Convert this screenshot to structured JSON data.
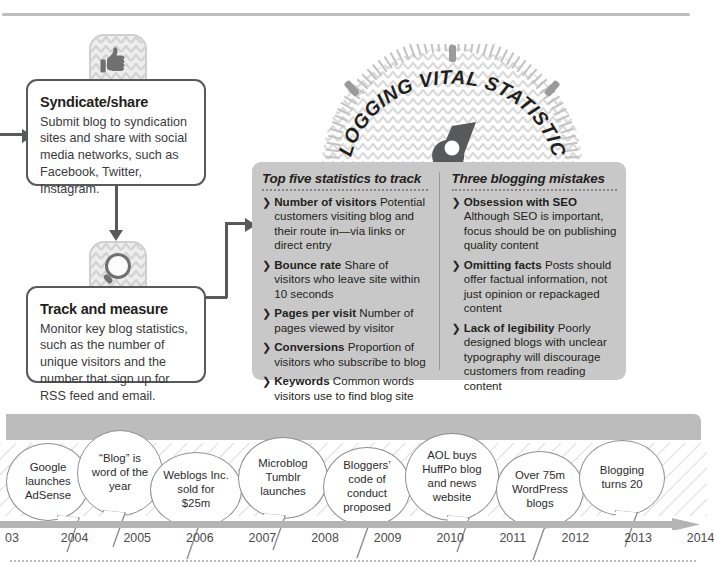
{
  "page": {
    "background": "#ffffff",
    "accent_gray": "#c8c8c8",
    "line_color": "#58595b"
  },
  "gauge": {
    "title": "BLOGGING VITAL STATISTICS",
    "needle": "gauge-needle"
  },
  "flow": {
    "steps": [
      {
        "icon": "thumbs-up-icon",
        "title": "Syndicate/share",
        "body": "Submit blog to syndication sites and share with social media networks, such as Facebook, Twitter, Instagram."
      },
      {
        "icon": "magnifier-icon",
        "title": "Track and measure",
        "body": "Monitor key blog statistics, such as the number of unique visitors and the number that sign up for RSS feed and email."
      }
    ]
  },
  "panel": {
    "left": {
      "heading": "Top five statistics to track",
      "items": [
        {
          "term": "Number of visitors",
          "desc": "Potential customers visiting blog and their route in—via links or direct entry"
        },
        {
          "term": "Bounce rate",
          "desc": "Share of visitors who leave site within 10 seconds"
        },
        {
          "term": "Pages per visit",
          "desc": "Number of pages viewed by visitor"
        },
        {
          "term": "Conversions",
          "desc": "Proportion of visitors who subscribe to blog"
        },
        {
          "term": "Keywords",
          "desc": "Common words visitors use to find blog site"
        }
      ]
    },
    "right": {
      "heading": "Three blogging mistakes",
      "items": [
        {
          "term": "Obsession with SEO",
          "desc": "Although SEO is important, focus should be on publishing quality content"
        },
        {
          "term": "Omitting facts",
          "desc": "Posts should offer factual information, not just opinion or repackaged content"
        },
        {
          "term": "Lack of legibility",
          "desc": "Poorly designed blogs with unclear typography will discourage customers from reading content"
        }
      ]
    },
    "bullet_glyph": "❯"
  },
  "timeline": {
    "years": [
      "03",
      "2004",
      "2005",
      "2006",
      "2007",
      "2008",
      "2009",
      "2010",
      "2011",
      "2012",
      "2013",
      "2014"
    ],
    "events": [
      {
        "year": "2003",
        "text": "Google launches AdSense"
      },
      {
        "year": "2004",
        "text": "“Blog” is word of the year"
      },
      {
        "year": "2005",
        "text": "Weblogs Inc. sold for $25m"
      },
      {
        "year": "2007",
        "text": "Microblog Tumblr launches"
      },
      {
        "year": "2008",
        "text": "Bloggers’ code of conduct proposed"
      },
      {
        "year": "2011",
        "text": "AOL buys HuffPo blog and news website"
      },
      {
        "year": "2012",
        "text": "Over 75m WordPress blogs"
      },
      {
        "year": "2014",
        "text": "Blogging turns 20"
      }
    ]
  }
}
